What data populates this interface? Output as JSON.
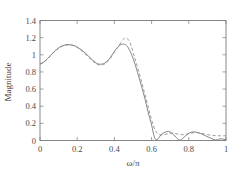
{
  "chart_data": {
    "type": "line",
    "title": "",
    "xlabel": "ω/π",
    "ylabel": "Magnitude",
    "xlim": [
      0,
      1
    ],
    "ylim": [
      0,
      1.4
    ],
    "xticks": [
      0,
      0.2,
      0.4,
      0.6,
      0.8,
      1
    ],
    "yticks": [
      0,
      0.2,
      0.4,
      0.6,
      0.8,
      1,
      1.2,
      1.4
    ],
    "xticklabels": [
      "0",
      "0.2",
      "0.4",
      "0.6",
      "0.8",
      "1"
    ],
    "yticklabels": [
      "0",
      "0.2",
      "0.4",
      "0.6",
      "0.8",
      "1",
      "1.2",
      "1.4"
    ],
    "grid": false,
    "legend": "none",
    "box": true,
    "series": [
      {
        "name": "solid-response",
        "style": "solid",
        "color": "#6f6f6f",
        "x": [
          0.0,
          0.02,
          0.04,
          0.06,
          0.08,
          0.1,
          0.12,
          0.15,
          0.18,
          0.2,
          0.23,
          0.26,
          0.29,
          0.31,
          0.34,
          0.37,
          0.4,
          0.425,
          0.445,
          0.465,
          0.485,
          0.505,
          0.525,
          0.545,
          0.565,
          0.585,
          0.6,
          0.615,
          0.63,
          0.65,
          0.67,
          0.69,
          0.71,
          0.73,
          0.75,
          0.765,
          0.785,
          0.805,
          0.825,
          0.845,
          0.865,
          0.885,
          0.905,
          0.925,
          0.945,
          0.96,
          0.975,
          1.0
        ],
        "y": [
          0.895,
          0.915,
          0.955,
          1.0,
          1.045,
          1.08,
          1.105,
          1.12,
          1.11,
          1.09,
          1.045,
          0.985,
          0.925,
          0.895,
          0.895,
          0.945,
          1.04,
          1.105,
          1.125,
          1.11,
          1.04,
          0.93,
          0.79,
          0.64,
          0.48,
          0.3,
          0.18,
          0.04,
          0.01,
          0.065,
          0.095,
          0.105,
          0.085,
          0.04,
          0.005,
          0.02,
          0.06,
          0.09,
          0.1,
          0.095,
          0.08,
          0.06,
          0.04,
          0.02,
          0.005,
          0.015,
          0.02,
          0.01
        ]
      },
      {
        "name": "dashed-response",
        "style": "dashed",
        "color": "#8a8a8a",
        "x": [
          0.0,
          0.02,
          0.04,
          0.06,
          0.08,
          0.1,
          0.12,
          0.15,
          0.18,
          0.2,
          0.23,
          0.26,
          0.29,
          0.31,
          0.34,
          0.37,
          0.4,
          0.425,
          0.445,
          0.46,
          0.475,
          0.49,
          0.51,
          0.53,
          0.55,
          0.57,
          0.59,
          0.61,
          0.63,
          0.65,
          0.67,
          0.69,
          0.71,
          0.73,
          0.75,
          0.77,
          0.79,
          0.81,
          0.83,
          0.85,
          0.87,
          0.89,
          0.91,
          0.93,
          0.95,
          0.97,
          1.0
        ],
        "y": [
          0.89,
          0.91,
          0.95,
          0.995,
          1.04,
          1.075,
          1.1,
          1.115,
          1.105,
          1.085,
          1.035,
          0.975,
          0.915,
          0.885,
          0.885,
          0.935,
          1.03,
          1.11,
          1.175,
          1.195,
          1.175,
          1.105,
          0.96,
          0.81,
          0.655,
          0.49,
          0.32,
          0.17,
          0.085,
          0.065,
          0.07,
          0.08,
          0.085,
          0.08,
          0.07,
          0.068,
          0.075,
          0.085,
          0.092,
          0.09,
          0.082,
          0.072,
          0.065,
          0.058,
          0.055,
          0.055,
          0.055
        ]
      }
    ]
  },
  "axes": {
    "label_x": "ω/π",
    "label_y": "Magnitude"
  }
}
